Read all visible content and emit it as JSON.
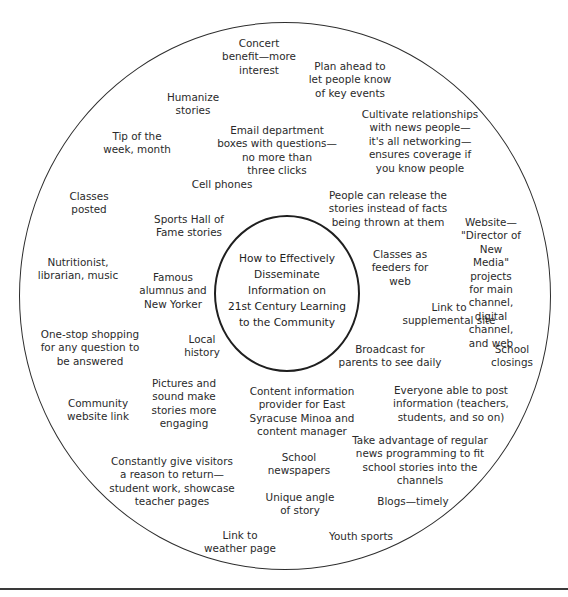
{
  "diagram": {
    "type": "bubble-brainstorm",
    "center_topic": "How to Effectively\nDisseminate\nInformation on\n21st Century Learning\nto the Community",
    "ideas": [
      {
        "id": "concert",
        "text": "Concert\nbenefit—more\ninterest",
        "x": 259,
        "y": 37
      },
      {
        "id": "plan-ahead",
        "text": "Plan ahead to\nlet people know\nof key events",
        "x": 350,
        "y": 60
      },
      {
        "id": "humanize",
        "text": "Humanize\nstories",
        "x": 193,
        "y": 91
      },
      {
        "id": "cultivate",
        "text": "Cultivate relationships\nwith news people—\nit's all networking—\nensures coverage if\nyou know people",
        "x": 420,
        "y": 108
      },
      {
        "id": "email-dept",
        "text": "Email department\nboxes with questions—\nno more than\nthree clicks",
        "x": 277,
        "y": 124
      },
      {
        "id": "tip-of-week",
        "text": "Tip of the\nweek, month",
        "x": 137,
        "y": 130
      },
      {
        "id": "cell-phones",
        "text": "Cell phones",
        "x": 222,
        "y": 178
      },
      {
        "id": "classes-posted",
        "text": "Classes\nposted",
        "x": 89,
        "y": 190
      },
      {
        "id": "release-stories",
        "text": "People can release the\nstories instead of facts\nbeing thrown at them",
        "x": 388,
        "y": 189
      },
      {
        "id": "sports-hall",
        "text": "Sports Hall of\nFame stories",
        "x": 189,
        "y": 213
      },
      {
        "id": "website-director",
        "text": "Website—\n\"Director of New\nMedia\" projects\nfor main channel,\ndigital channel,\nand web",
        "x": 491,
        "y": 216
      },
      {
        "id": "classes-feeders",
        "text": "Classes as\nfeeders for\nweb",
        "x": 400,
        "y": 248
      },
      {
        "id": "nutritionist",
        "text": "Nutritionist,\nlibrarian, music",
        "x": 78,
        "y": 256
      },
      {
        "id": "famous-alumnus",
        "text": "Famous\nalumnus and\nNew Yorker",
        "x": 173,
        "y": 271
      },
      {
        "id": "link-supplemental",
        "text": "Link to\nsupplemental site",
        "x": 449,
        "y": 301
      },
      {
        "id": "one-stop",
        "text": "One-stop shopping\nfor any question to\nbe answered",
        "x": 90,
        "y": 328
      },
      {
        "id": "local-history",
        "text": "Local\nhistory",
        "x": 202,
        "y": 333
      },
      {
        "id": "broadcast",
        "text": "Broadcast for\nparents to see daily",
        "x": 390,
        "y": 343
      },
      {
        "id": "school-closings",
        "text": "School\nclosings",
        "x": 512,
        "y": 343
      },
      {
        "id": "pictures-sound",
        "text": "Pictures and\nsound make\nstories more\nengaging",
        "x": 184,
        "y": 377
      },
      {
        "id": "content-provider",
        "text": "Content information\nprovider for East\nSyracuse Minoa and\ncontent manager",
        "x": 302,
        "y": 385
      },
      {
        "id": "everyone-post",
        "text": "Everyone able to post\ninformation (teachers,\nstudents, and so on)",
        "x": 451,
        "y": 384
      },
      {
        "id": "community-website",
        "text": "Community\nwebsite link",
        "x": 98,
        "y": 397
      },
      {
        "id": "take-advantage",
        "text": "Take advantage of regular\nnews programming to fit\nschool stories into the\nchannels",
        "x": 420,
        "y": 434
      },
      {
        "id": "constantly-give",
        "text": "Constantly give visitors\na reason to return—\nstudent work, showcase\nteacher pages",
        "x": 172,
        "y": 455
      },
      {
        "id": "school-newspapers",
        "text": "School\nnewspapers",
        "x": 299,
        "y": 451
      },
      {
        "id": "unique-angle",
        "text": "Unique angle\nof story",
        "x": 300,
        "y": 491
      },
      {
        "id": "blogs",
        "text": "Blogs—timely",
        "x": 413,
        "y": 495
      },
      {
        "id": "link-weather",
        "text": "Link to\nweather page",
        "x": 240,
        "y": 529
      },
      {
        "id": "youth-sports",
        "text": "Youth sports",
        "x": 361,
        "y": 530
      }
    ]
  }
}
